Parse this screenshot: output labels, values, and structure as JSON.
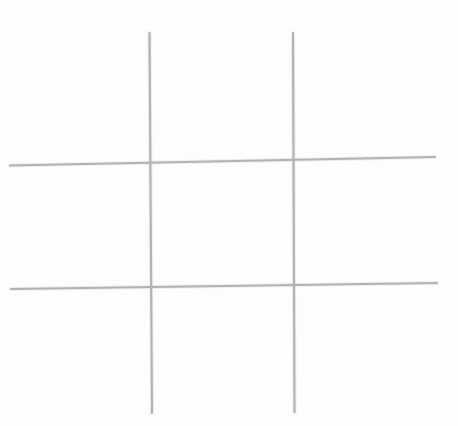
{
  "canvas": {
    "width": 458,
    "height": 426,
    "background_color": "#fdfdfd",
    "title": "Tic-Tac-Toe Grid",
    "description": "Hand-drawn empty tic-tac-toe (noughts and crosses) board: two vertical and two horizontal light grey lines forming a 3x3 grid of nine empty cells."
  },
  "drawing": {
    "style": "hand-drawn pencil sketch",
    "stroke_color": "#b2b2b2",
    "halo_color": "#d8d8d8",
    "stroke_width": 2,
    "halo_width": 4,
    "line_count": 4,
    "cell_count": 9,
    "marks_placed": 0
  },
  "lines": [
    {
      "name": "vertical-line-left",
      "orientation": "vertical",
      "x1": 149.5,
      "y1": 33,
      "x2": 152.0,
      "y2": 413,
      "stroke_color": "#b2b2b2",
      "stroke_width": 2.1
    },
    {
      "name": "vertical-line-right",
      "orientation": "vertical",
      "x1": 293.0,
      "y1": 33,
      "x2": 294.5,
      "y2": 412,
      "stroke_color": "#b2b2b2",
      "stroke_width": 2.1
    },
    {
      "name": "horizontal-line-top",
      "orientation": "horizontal",
      "x1": 10,
      "y1": 165.5,
      "x2": 435,
      "y2": 157.0,
      "stroke_color": "#b2b2b2",
      "stroke_width": 2.0
    },
    {
      "name": "horizontal-line-bottom",
      "orientation": "horizontal",
      "x1": 11,
      "y1": 289.0,
      "x2": 437,
      "y2": 283.0,
      "stroke_color": "#b2b2b2",
      "stroke_width": 2.0
    }
  ],
  "intersections": [
    {
      "name": "intersection-top-left",
      "x": 149.5,
      "y": 162.0
    },
    {
      "name": "intersection-top-right",
      "x": 293.5,
      "y": 159.0
    },
    {
      "name": "intersection-bottom-left",
      "x": 150.5,
      "y": 285.5
    },
    {
      "name": "intersection-bottom-right",
      "x": 294.0,
      "y": 284.0
    }
  ],
  "cells": [
    {
      "name": "cell-top-left",
      "row": 1,
      "col": 1,
      "mark": "",
      "cx": 80,
      "cy": 98
    },
    {
      "name": "cell-top-center",
      "row": 1,
      "col": 2,
      "mark": "",
      "cx": 221,
      "cy": 97
    },
    {
      "name": "cell-top-right",
      "row": 1,
      "col": 3,
      "mark": "",
      "cx": 365,
      "cy": 96
    },
    {
      "name": "cell-middle-left",
      "row": 2,
      "col": 1,
      "mark": "",
      "cx": 80,
      "cy": 224
    },
    {
      "name": "cell-middle-center",
      "row": 2,
      "col": 2,
      "mark": "",
      "cx": 221,
      "cy": 222
    },
    {
      "name": "cell-middle-right",
      "row": 2,
      "col": 3,
      "mark": "",
      "cx": 365,
      "cy": 221
    },
    {
      "name": "cell-bottom-left",
      "row": 3,
      "col": 1,
      "mark": "",
      "cx": 80,
      "cy": 350
    },
    {
      "name": "cell-bottom-center",
      "row": 3,
      "col": 2,
      "mark": "",
      "cx": 221,
      "cy": 348
    },
    {
      "name": "cell-bottom-right",
      "row": 3,
      "col": 3,
      "mark": "",
      "cx": 365,
      "cy": 347
    }
  ]
}
